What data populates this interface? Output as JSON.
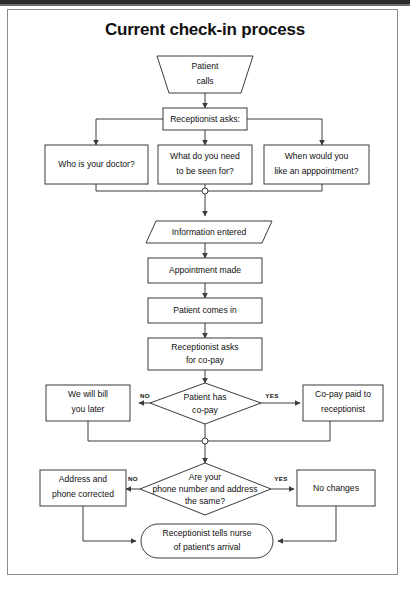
{
  "page": {
    "title": "Current check-in process"
  },
  "flowchart": {
    "nodes": {
      "patient_calls": {
        "label_line1": "Patient",
        "label_line2": "calls",
        "shape": "trapezoid"
      },
      "receptionist_asks": {
        "label_line1": "Receptionist asks:",
        "label_line2": "",
        "shape": "rect"
      },
      "q_doctor": {
        "label_line1": "Who is your doctor?",
        "label_line2": "",
        "shape": "rect"
      },
      "q_seen_for": {
        "label_line1": "What do you need",
        "label_line2": "to be seen for?",
        "shape": "rect"
      },
      "q_appointment": {
        "label_line1": "When would you",
        "label_line2": "like an apppointment?",
        "shape": "rect"
      },
      "information_entered": {
        "label_line1": "Information entered",
        "label_line2": "",
        "shape": "parallelogram"
      },
      "appointment_made": {
        "label_line1": "Appointment made",
        "label_line2": "",
        "shape": "rect"
      },
      "patient_comes_in": {
        "label_line1": "Patient comes in",
        "label_line2": "",
        "shape": "rect"
      },
      "asks_for_copay": {
        "label_line1": "Receptionist asks",
        "label_line2": "for co-pay",
        "shape": "rect"
      },
      "decision_copay": {
        "label_line1": "Patient has",
        "label_line2": "co-pay",
        "shape": "diamond"
      },
      "bill_later": {
        "label_line1": "We will bill",
        "label_line2": "you later",
        "shape": "rect"
      },
      "copay_paid": {
        "label_line1": "Co-pay paid to",
        "label_line2": "receptionist",
        "shape": "rect"
      },
      "decision_address": {
        "label_line1": "Are your",
        "label_line2": "phone number and address",
        "label_line3": "the same?",
        "shape": "diamond"
      },
      "address_corrected": {
        "label_line1": "Address and",
        "label_line2": "phone corrected",
        "shape": "rect"
      },
      "no_changes": {
        "label_line1": "No changes",
        "label_line2": "",
        "shape": "rect"
      },
      "tells_nurse": {
        "label_line1": "Receptionist tells nurse",
        "label_line2": "of patient's arrival",
        "shape": "stadium"
      }
    },
    "edge_labels": {
      "copay_no": "NO",
      "copay_yes": "YES",
      "address_no": "NO",
      "address_yes": "YES"
    },
    "colors": {
      "stroke": "#3b3b3b",
      "text": "#111111",
      "fill": "#ffffff",
      "frame": "#8d8d8d"
    }
  }
}
